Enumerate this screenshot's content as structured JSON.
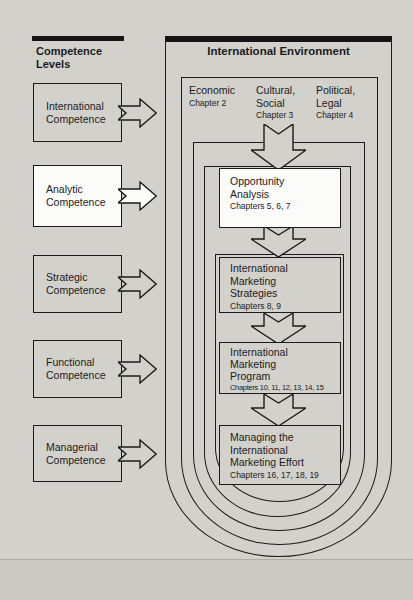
{
  "left_panel": {
    "header": {
      "line1": "Competence",
      "line2": "Levels"
    },
    "boxes": [
      {
        "line1": "International",
        "line2": "Competence"
      },
      {
        "line1": "Analytic",
        "line2": "Competence"
      },
      {
        "line1": "Strategic",
        "line2": "Competence"
      },
      {
        "line1": "Functional",
        "line2": "Competence"
      },
      {
        "line1": "Managerial",
        "line2": "Competence"
      }
    ]
  },
  "environment": {
    "title": "International Environment",
    "sectors": [
      {
        "line1": "Economic",
        "line2": "",
        "chapter": "Chapter 2"
      },
      {
        "line1": "Cultural,",
        "line2": "Social",
        "chapter": "Chapter 3"
      },
      {
        "line1": "Political,",
        "line2": "Legal",
        "chapter": "Chapter 4"
      }
    ],
    "flow_boxes": [
      {
        "line1": "Opportunity",
        "line2": "Analysis",
        "line3": "",
        "chapters": "Chapters 5, 6, 7"
      },
      {
        "line1": "International",
        "line2": "Marketing",
        "line3": "Strategies",
        "chapters": "Chapters 8, 9"
      },
      {
        "line1": "International",
        "line2": "Marketing",
        "line3": "Program",
        "chapters": "Chapters 10, 11, 12, 13, 14, 15"
      },
      {
        "line1": "Managing the",
        "line2": "International",
        "line3": "Marketing Effort",
        "chapters": "Chapters 16, 17, 18, 19"
      }
    ]
  },
  "colors": {
    "background": "#d2d1cc",
    "line": "#1b1b1b",
    "highlight_box": "#fbfbf9",
    "footer_band": "#cac9c4",
    "header_bar": "#151515"
  }
}
